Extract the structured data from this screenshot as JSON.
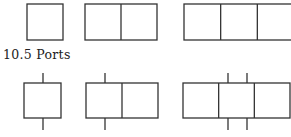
{
  "section": {
    "heading": "10.5 Ports"
  },
  "colors": {
    "stroke": "#333333",
    "background": "#ffffff"
  },
  "diagram": {
    "top_row": [
      {
        "x": 27,
        "y": 4,
        "w": 36,
        "h": 36,
        "cells": 1,
        "ports": []
      },
      {
        "x": 85,
        "y": 4,
        "w": 72,
        "h": 36,
        "cells": 2,
        "ports": []
      },
      {
        "x": 184,
        "y": 4,
        "w": 110,
        "h": 36,
        "cells": 3,
        "ports": []
      }
    ],
    "bottom_row": [
      {
        "x": 24,
        "y": 83,
        "w": 37,
        "h": 35,
        "cells": 1,
        "ports": [
          43
        ]
      },
      {
        "x": 86,
        "y": 83,
        "w": 72,
        "h": 35,
        "cells": 2,
        "ports": [
          105
        ]
      },
      {
        "x": 183,
        "y": 83,
        "w": 107,
        "h": 35,
        "cells": 3,
        "ports": [
          228,
          247
        ]
      }
    ]
  }
}
